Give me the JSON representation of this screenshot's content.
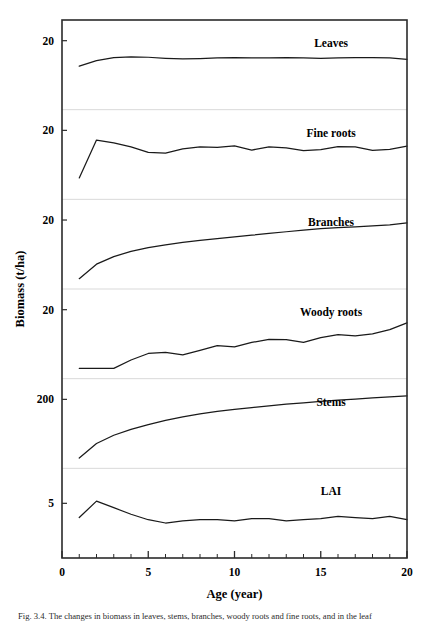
{
  "figure": {
    "axis_titles": {
      "y": "Biomass (t/ha)",
      "x": "Age (year)"
    },
    "caption": "Fig. 3.4. The changes in biomass in leaves, stems, branches, woody roots and fine roots, and in the leaf",
    "line_color": "#1a1a1a",
    "frame_color": "#2b2b2b",
    "separator_color": "#d9d9d9"
  },
  "chart_data": {
    "type": "line",
    "title": "",
    "xlabel": "Age (year)",
    "ylabel": "Biomass (t/ha)",
    "xlim": [
      0,
      20
    ],
    "x_major_ticks": [
      0,
      5,
      10,
      15,
      20
    ],
    "x_minor_ticks": [
      1,
      2,
      3,
      4,
      6,
      7,
      8,
      9,
      11,
      12,
      13,
      14,
      16,
      17,
      18,
      19
    ],
    "grid": false,
    "legend_position": "in-panel-right",
    "layout": "6 stacked panels sharing one x-axis, each with a single y tick label",
    "x": [
      1,
      2,
      3,
      4,
      5,
      6,
      7,
      8,
      9,
      10,
      11,
      12,
      13,
      14,
      15,
      16,
      17,
      18,
      19,
      20
    ],
    "panels": [
      {
        "name": "Leaves",
        "label": "Leaves",
        "y_tick_label": "20",
        "y_tick_value": 20,
        "ylim": [
          0,
          26
        ],
        "values": [
          12.6,
          14.2,
          15.1,
          15.3,
          15.2,
          14.9,
          14.7,
          14.8,
          15.0,
          15.1,
          15.0,
          15.0,
          15.1,
          15.0,
          14.9,
          15.0,
          15.1,
          15.1,
          15.0,
          14.6
        ]
      },
      {
        "name": "Fine roots",
        "label": "Fine roots",
        "y_tick_label": "20",
        "y_tick_value": 20,
        "ylim": [
          0,
          26
        ],
        "values": [
          6.2,
          17.2,
          16.4,
          15.2,
          13.6,
          13.4,
          14.6,
          15.2,
          15.1,
          15.5,
          14.3,
          15.2,
          14.9,
          14.1,
          14.4,
          15.3,
          15.2,
          14.2,
          14.5,
          15.4
        ]
      },
      {
        "name": "Branches",
        "label": "Branches",
        "y_tick_label": "20",
        "y_tick_value": 20,
        "ylim": [
          0,
          26
        ],
        "values": [
          3.0,
          7.2,
          9.4,
          10.9,
          12.0,
          12.8,
          13.5,
          14.1,
          14.6,
          15.1,
          15.6,
          16.1,
          16.6,
          17.1,
          17.5,
          17.8,
          18.0,
          18.3,
          18.6,
          19.2
        ]
      },
      {
        "name": "Woody roots",
        "label": "Woody roots",
        "y_tick_label": "20",
        "y_tick_value": 20,
        "ylim": [
          0,
          26
        ],
        "values": [
          3.0,
          3.0,
          3.0,
          5.4,
          7.3,
          7.6,
          6.9,
          8.2,
          9.6,
          9.2,
          10.5,
          11.4,
          11.3,
          10.5,
          11.9,
          12.8,
          12.4,
          13.0,
          14.2,
          16.2
        ]
      },
      {
        "name": "Stems",
        "label": "Stems",
        "y_tick_label": "200",
        "y_tick_value": 200,
        "ylim": [
          0,
          260
        ],
        "values": [
          30,
          72,
          96,
          113,
          127,
          139,
          149,
          158,
          165,
          171,
          176,
          181,
          186,
          190,
          194,
          198,
          201,
          204,
          207,
          210
        ]
      },
      {
        "name": "LAI",
        "label": "LAI",
        "y_tick_label": "5",
        "y_tick_value": 5,
        "ylim": [
          0,
          8.2
        ],
        "values": [
          3.7,
          5.2,
          4.6,
          4.0,
          3.5,
          3.2,
          3.4,
          3.5,
          3.5,
          3.4,
          3.6,
          3.6,
          3.4,
          3.5,
          3.6,
          3.8,
          3.7,
          3.6,
          3.8,
          3.5
        ]
      }
    ]
  }
}
